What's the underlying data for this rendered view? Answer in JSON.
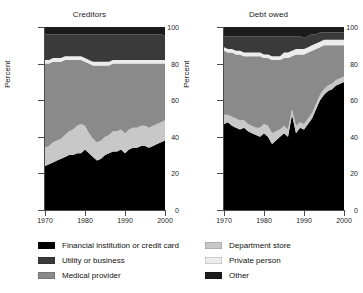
{
  "figure": {
    "ylabel": "Percent",
    "yticks": [
      0,
      20,
      40,
      60,
      80,
      100
    ],
    "xticks": [
      1970,
      1980,
      1990,
      2000
    ],
    "panels": [
      "Creditors",
      "Debt owed"
    ]
  },
  "legend": {
    "column1": [
      {
        "label": "Financial institution or credit card",
        "color": "#000000"
      },
      {
        "label": "Utility or business",
        "color": "#3a3a3a"
      },
      {
        "label": "Medical provider",
        "color": "#8a8a8a"
      }
    ],
    "column2": [
      {
        "label": "Department store",
        "color": "#c8c8c8"
      },
      {
        "label": "Private person",
        "color": "#ececec"
      },
      {
        "label": "Other",
        "color": "#1c1c1c"
      }
    ]
  },
  "chart_data": [
    {
      "type": "area",
      "title": "Creditors",
      "xlabel": "",
      "ylabel": "Percent",
      "ylim": [
        0,
        100
      ],
      "xlim": [
        1970,
        2000
      ],
      "stacked": true,
      "grid": false,
      "legend_position": "below",
      "x": [
        1970,
        1971,
        1972,
        1973,
        1974,
        1975,
        1976,
        1977,
        1978,
        1979,
        1980,
        1981,
        1982,
        1983,
        1984,
        1985,
        1986,
        1987,
        1988,
        1989,
        1990,
        1991,
        1992,
        1993,
        1994,
        1995,
        1996,
        1997,
        1998,
        1999,
        2000
      ],
      "series": [
        {
          "name": "Financial institution or credit card",
          "color": "#000000",
          "values": [
            24,
            25,
            26,
            27,
            28,
            29,
            30,
            30,
            31,
            31,
            33,
            31,
            29,
            27,
            28,
            30,
            31,
            32,
            32,
            33,
            31,
            33,
            34,
            34,
            35,
            35,
            34,
            35,
            36,
            37,
            38
          ]
        },
        {
          "name": "Department store",
          "color": "#c8c8c8",
          "values": [
            10,
            10,
            11,
            11,
            11,
            12,
            13,
            14,
            15,
            16,
            13,
            11,
            10,
            10,
            10,
            10,
            10,
            11,
            11,
            11,
            11,
            11,
            11,
            11,
            11,
            11,
            11,
            11,
            11,
            11,
            11
          ]
        },
        {
          "name": "Medical provider",
          "color": "#8a8a8a",
          "values": [
            46,
            45,
            44,
            43,
            42,
            41,
            39,
            38,
            36,
            35,
            35,
            38,
            40,
            42,
            41,
            39,
            38,
            37,
            37,
            36,
            38,
            36,
            35,
            35,
            34,
            34,
            35,
            34,
            33,
            32,
            31
          ]
        },
        {
          "name": "Private person",
          "color": "#ececec",
          "values": [
            2,
            2,
            2,
            2,
            2,
            2,
            2,
            2,
            2,
            2,
            2,
            2,
            2,
            2,
            2,
            2,
            2,
            2,
            2,
            2,
            2,
            2,
            2,
            2,
            2,
            2,
            2,
            2,
            2,
            2,
            2
          ]
        },
        {
          "name": "Utility or business",
          "color": "#3a3a3a",
          "values": [
            14,
            14,
            13,
            13,
            13,
            12,
            12,
            12,
            12,
            12,
            13,
            14,
            15,
            15,
            15,
            15,
            15,
            14,
            14,
            14,
            14,
            14,
            14,
            14,
            14,
            14,
            14,
            14,
            14,
            14,
            13
          ]
        },
        {
          "name": "Other",
          "color": "#1c1c1c",
          "values": [
            4,
            4,
            4,
            4,
            4,
            4,
            4,
            4,
            4,
            4,
            4,
            4,
            4,
            4,
            4,
            4,
            4,
            4,
            4,
            4,
            4,
            4,
            4,
            4,
            4,
            4,
            4,
            4,
            4,
            4,
            5
          ]
        }
      ]
    },
    {
      "type": "area",
      "title": "Debt owed",
      "xlabel": "",
      "ylabel": "Percent",
      "ylim": [
        0,
        100
      ],
      "xlim": [
        1970,
        2000
      ],
      "stacked": true,
      "grid": false,
      "legend_position": "below",
      "x": [
        1970,
        1971,
        1972,
        1973,
        1974,
        1975,
        1976,
        1977,
        1978,
        1979,
        1980,
        1981,
        1982,
        1983,
        1984,
        1985,
        1986,
        1987,
        1988,
        1989,
        1990,
        1991,
        1992,
        1993,
        1994,
        1995,
        1996,
        1997,
        1998,
        1999,
        2000
      ],
      "series": [
        {
          "name": "Financial institution or credit card",
          "color": "#000000",
          "values": [
            47,
            48,
            46,
            45,
            44,
            45,
            43,
            42,
            41,
            40,
            42,
            40,
            36,
            38,
            40,
            42,
            40,
            52,
            42,
            45,
            44,
            47,
            50,
            55,
            60,
            63,
            65,
            66,
            68,
            69,
            70
          ]
        },
        {
          "name": "Department store",
          "color": "#c8c8c8",
          "values": [
            5,
            4,
            5,
            5,
            5,
            4,
            4,
            4,
            4,
            5,
            5,
            6,
            6,
            5,
            4,
            4,
            4,
            3,
            4,
            3,
            3,
            3,
            3,
            3,
            3,
            3,
            3,
            3,
            3,
            3,
            3
          ]
        },
        {
          "name": "Medical provider",
          "color": "#8a8a8a",
          "values": [
            35,
            34,
            35,
            35,
            36,
            35,
            37,
            38,
            39,
            39,
            36,
            37,
            40,
            39,
            38,
            37,
            39,
            29,
            39,
            37,
            38,
            36,
            34,
            30,
            26,
            24,
            22,
            21,
            19,
            18,
            17
          ]
        },
        {
          "name": "Private person",
          "color": "#ececec",
          "values": [
            2,
            2,
            2,
            2,
            2,
            2,
            2,
            2,
            2,
            2,
            2,
            2,
            2,
            2,
            2,
            3,
            3,
            3,
            3,
            3,
            3,
            3,
            3,
            3,
            3,
            3,
            3,
            3,
            3,
            3,
            3
          ]
        },
        {
          "name": "Utility or business",
          "color": "#3a3a3a",
          "values": [
            6,
            7,
            7,
            8,
            8,
            9,
            9,
            9,
            9,
            9,
            10,
            10,
            11,
            11,
            11,
            9,
            9,
            8,
            7,
            7,
            6,
            6,
            6,
            5,
            5,
            4,
            4,
            4,
            4,
            4,
            4
          ]
        },
        {
          "name": "Other",
          "color": "#1c1c1c",
          "values": [
            5,
            5,
            5,
            5,
            5,
            5,
            5,
            5,
            5,
            5,
            5,
            5,
            5,
            5,
            5,
            5,
            5,
            5,
            5,
            5,
            6,
            5,
            4,
            4,
            3,
            3,
            3,
            3,
            3,
            3,
            3
          ]
        }
      ]
    }
  ]
}
